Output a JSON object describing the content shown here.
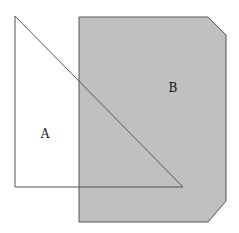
{
  "diagram": {
    "shapes": [
      {
        "id": "B",
        "label": "B",
        "kind": "chamfered-rectangle",
        "fill": "#c0c0c0",
        "stroke": "#555555",
        "points": "79,17 208,17 226,35 226,201 208,222 79,222",
        "label_pos": {
          "x": 173,
          "y": 92
        }
      },
      {
        "id": "A",
        "label": "A",
        "kind": "right-triangle",
        "fill": "none",
        "stroke": "#555555",
        "points": "15,16 15,187 183,187",
        "label_pos": {
          "x": 45,
          "y": 138
        }
      }
    ]
  }
}
